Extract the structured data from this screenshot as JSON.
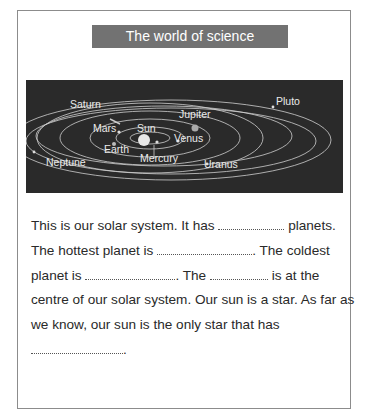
{
  "title": "The world of science",
  "diagram": {
    "labels": {
      "saturn": "Saturn",
      "jupiter": "Jupiter",
      "pluto": "Pluto",
      "mars": "Mars",
      "sun": "Sun",
      "venus": "Venus",
      "earth": "Earth",
      "mercury": "Mercury",
      "neptune": "Neptune",
      "uranus": "Uranus"
    },
    "background_color": "#2a2a2a"
  },
  "passage": {
    "l1a": "This is our solar system. It has ",
    "l1b": " planets.",
    "l2a": "The hottest planet is ",
    "l2b": ". The coldest",
    "l3a": "planet is ",
    "l3b": ". The ",
    "l3c": " is at the",
    "l4": "centre of our solar system. Our sun is a star. As far as",
    "l5": "we know, our sun is the only star that has",
    "l6b": "."
  }
}
